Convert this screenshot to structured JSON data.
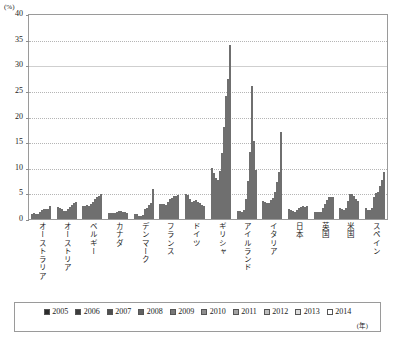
{
  "chart_data": {
    "type": "bar",
    "title": "",
    "xlabel": "",
    "ylabel": "(%)",
    "ylim": [
      0,
      40
    ],
    "yticks": [
      0,
      5,
      10,
      15,
      20,
      25,
      30,
      35,
      40
    ],
    "grid": true,
    "legend_position": "bottom",
    "year_unit": "(年)",
    "categories": [
      "オーストラリア",
      "オーストリア",
      "ベルギー",
      "カナダ",
      "デンマーク",
      "フランス",
      "ドイツ",
      "ギリシャ",
      "アイルランド",
      "イタリア",
      "日本",
      "英国",
      "米国",
      "スペイン"
    ],
    "series": [
      {
        "name": "2005",
        "color": "#2b2b2b",
        "values": [
          1.0,
          2.4,
          2.6,
          1.2,
          1.0,
          2.9,
          4.9,
          10.0,
          1.6,
          3.5,
          1.9,
          1.3,
          2.1,
          2.2
        ]
      },
      {
        "name": "2006",
        "color": "#3c3c3c",
        "values": [
          1.1,
          2.2,
          2.6,
          1.1,
          0.9,
          2.9,
          4.6,
          8.9,
          1.5,
          3.4,
          1.7,
          1.3,
          1.9,
          1.8
        ]
      },
      {
        "name": "2007",
        "color": "#4f4f4f",
        "values": [
          1.0,
          1.9,
          2.7,
          1.1,
          0.6,
          2.9,
          3.9,
          8.1,
          1.4,
          3.1,
          1.5,
          1.3,
          1.8,
          1.8
        ]
      },
      {
        "name": "2008",
        "color": "#636363",
        "values": [
          0.9,
          1.5,
          2.6,
          1.1,
          0.5,
          2.8,
          3.4,
          7.7,
          1.8,
          3.1,
          1.3,
          1.4,
          2.1,
          2.2
        ]
      },
      {
        "name": "2009",
        "color": "#787878",
        "values": [
          1.3,
          1.6,
          2.9,
          1.4,
          0.7,
          3.3,
          3.5,
          9.4,
          3.9,
          3.8,
          1.7,
          2.1,
          3.5,
          4.3
        ]
      },
      {
        "name": "2010",
        "color": "#8d8d8d",
        "values": [
          1.7,
          1.9,
          3.4,
          1.6,
          1.9,
          3.9,
          3.7,
          12.9,
          7.4,
          4.1,
          2.1,
          3.0,
          4.9,
          5.1
        ]
      },
      {
        "name": "2011",
        "color": "#a3a3a3",
        "values": [
          1.9,
          2.3,
          3.9,
          1.5,
          2.2,
          4.1,
          3.4,
          17.9,
          13.1,
          5.3,
          2.4,
          3.8,
          4.8,
          5.3
        ]
      },
      {
        "name": "2012",
        "color": "#bdbdbd",
        "values": [
          2.0,
          2.7,
          4.2,
          1.4,
          2.8,
          4.4,
          3.1,
          24.1,
          25.9,
          7.2,
          2.5,
          4.3,
          4.5,
          6.4
        ]
      },
      {
        "name": "2013",
        "color": "#dcdcdc",
        "values": [
          2.0,
          3.2,
          4.5,
          1.3,
          3.2,
          4.5,
          2.8,
          27.4,
          15.3,
          9.1,
          2.4,
          4.2,
          4.0,
          7.6
        ]
      },
      {
        "name": "2014",
        "color": "#ffffff",
        "values": [
          2.6,
          3.4,
          4.8,
          1.2,
          5.8,
          4.7,
          2.6,
          33.9,
          9.5,
          16.9,
          2.5,
          4.3,
          3.6,
          9.1
        ]
      }
    ]
  }
}
